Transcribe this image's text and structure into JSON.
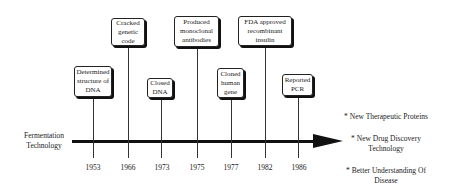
{
  "diagram": {
    "start_label": "Fermentation Technology",
    "events": [
      {
        "year": "1953",
        "label": "Determined structure of DNA",
        "x": 93
      },
      {
        "year": "1966",
        "label": "Cracked genetic code",
        "x": 128
      },
      {
        "year": "1973",
        "label": "Closed DNA",
        "x": 161
      },
      {
        "year": "1975",
        "label": "Produced monoclonal antibodies",
        "x": 197
      },
      {
        "year": "1977",
        "label": "Cloned human gene",
        "x": 231
      },
      {
        "year": "1982",
        "label": "FDA approved recombinant insulin",
        "x": 265
      },
      {
        "year": "1986",
        "label": "Reported PCR",
        "x": 298
      }
    ],
    "outcomes": [
      "* New Therapeutic Proteins",
      "* New Drug Discovery Technology",
      "* Better Understanding Of Disease"
    ],
    "colors": {
      "line": "#111111",
      "box_border": "#222222",
      "background": "#ffffff"
    }
  }
}
